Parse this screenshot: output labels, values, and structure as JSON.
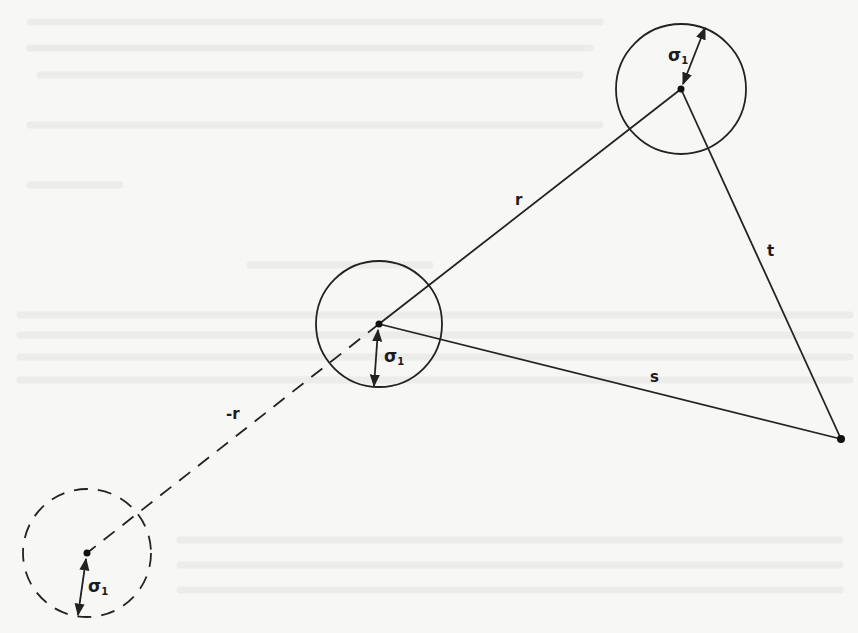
{
  "diagram": {
    "type": "geometry-figure",
    "colors": {
      "ink": "#222222",
      "paper": "#f7f7f5",
      "ghost": "#ececea"
    },
    "points": {
      "top": {
        "x": 681,
        "y": 89
      },
      "middle": {
        "x": 379,
        "y": 324
      },
      "right": {
        "x": 841,
        "y": 439
      },
      "reflected": {
        "x": 87,
        "y": 553
      }
    },
    "circles": [
      {
        "id": "top",
        "cx": 681,
        "cy": 89,
        "r": 65,
        "style": "solid",
        "radius_label": "σ1"
      },
      {
        "id": "middle",
        "cx": 379,
        "cy": 324,
        "r": 63,
        "style": "solid",
        "radius_label": "σ1"
      },
      {
        "id": "reflected",
        "cx": 87,
        "cy": 553,
        "r": 64,
        "style": "dashed",
        "radius_label": "σ1"
      }
    ],
    "segments": [
      {
        "from": "middle",
        "to": "top",
        "label": "r",
        "style": "solid"
      },
      {
        "from": "middle",
        "to": "right",
        "label": "s",
        "style": "solid"
      },
      {
        "from": "top",
        "to": "right",
        "label": "t",
        "style": "solid"
      },
      {
        "from": "middle",
        "to": "reflected",
        "label": "-r",
        "style": "dashed"
      }
    ],
    "labels": {
      "r": "r",
      "s": "s",
      "t": "t",
      "neg_r": "-r",
      "sigma_symbol": "σ",
      "sigma_sub": "1"
    }
  }
}
